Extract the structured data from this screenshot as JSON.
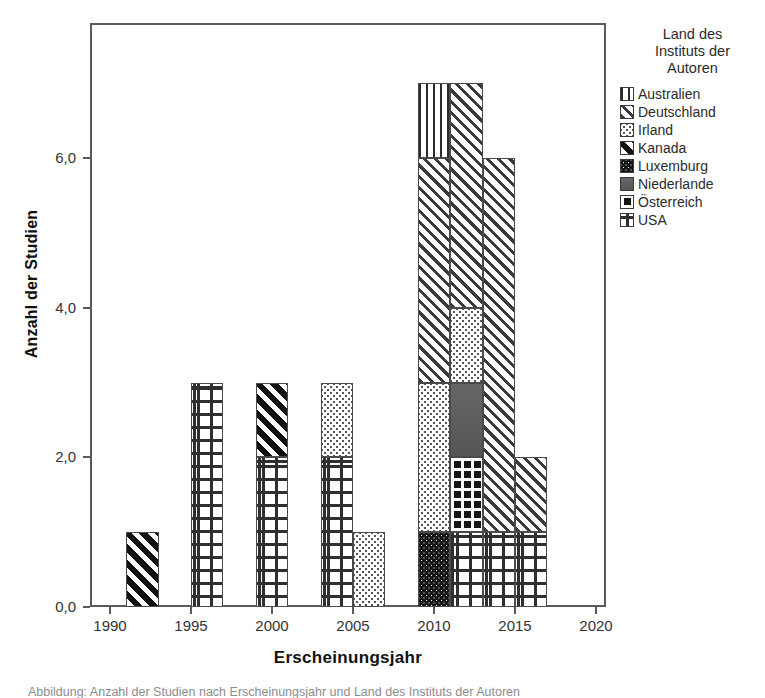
{
  "chart_data": {
    "type": "bar",
    "title": "",
    "xlabel": "Erscheinungsjahr",
    "ylabel": "Anzahl der Studien",
    "xlim": [
      1988.5,
      2021.5
    ],
    "ylim": [
      0,
      7.8
    ],
    "grid": false,
    "legend_position": "right",
    "legend_title": "Land des Instituts der Autoren",
    "stacked": true,
    "series": [
      {
        "name": "Australien",
        "pattern": "vertical-lines"
      },
      {
        "name": "Deutschland",
        "pattern": "diagonal-hatch"
      },
      {
        "name": "Irland",
        "pattern": "light-stipple"
      },
      {
        "name": "Kanada",
        "pattern": "dark-diagonal"
      },
      {
        "name": "Luxemburg",
        "pattern": "dark-dotted"
      },
      {
        "name": "Niederlande",
        "pattern": "solid-gray"
      },
      {
        "name": "Österreich",
        "pattern": "dark-grid"
      },
      {
        "name": "USA",
        "pattern": "cross-hatch"
      }
    ],
    "xticks": [
      1990,
      1995,
      2000,
      2005,
      2010,
      2015,
      2020
    ],
    "xtick_labels": [
      "1990",
      "1995",
      "2000",
      "2005",
      "2010",
      "2015",
      "2020"
    ],
    "yticks": [
      0,
      2,
      4,
      6
    ],
    "ytick_labels": [
      "0,0",
      "2,0",
      "4,0",
      "6,0"
    ],
    "bars": [
      {
        "year_start": 1991,
        "year_end": 1993,
        "total": 1,
        "segments": [
          {
            "name": "Kanada",
            "value": 1
          }
        ]
      },
      {
        "year_start": 1995,
        "year_end": 1997,
        "total": 3,
        "segments": [
          {
            "name": "USA",
            "value": 3
          }
        ]
      },
      {
        "year_start": 1999,
        "year_end": 2001,
        "total": 3,
        "segments": [
          {
            "name": "USA",
            "value": 2
          },
          {
            "name": "Kanada",
            "value": 1
          }
        ]
      },
      {
        "year_start": 2003,
        "year_end": 2005,
        "total": 3,
        "segments": [
          {
            "name": "USA",
            "value": 2
          },
          {
            "name": "Irland",
            "value": 1
          }
        ]
      },
      {
        "year_start": 2005,
        "year_end": 2007,
        "total": 1,
        "segments": [
          {
            "name": "Irland",
            "value": 1
          }
        ]
      },
      {
        "year_start": 2009,
        "year_end": 2011,
        "total": 7,
        "segments": [
          {
            "name": "Luxemburg",
            "value": 1
          },
          {
            "name": "Irland",
            "value": 2
          },
          {
            "name": "Deutschland",
            "value": 3
          },
          {
            "name": "Australien",
            "value": 1
          }
        ]
      },
      {
        "year_start": 2011,
        "year_end": 2013,
        "total": 7,
        "segments": [
          {
            "name": "USA",
            "value": 1
          },
          {
            "name": "Österreich",
            "value": 1
          },
          {
            "name": "Niederlande",
            "value": 1
          },
          {
            "name": "Irland",
            "value": 1
          },
          {
            "name": "Deutschland",
            "value": 3
          }
        ]
      },
      {
        "year_start": 2013,
        "year_end": 2015,
        "total": 6,
        "segments": [
          {
            "name": "USA",
            "value": 1
          },
          {
            "name": "Deutschland",
            "value": 5
          }
        ]
      },
      {
        "year_start": 2015,
        "year_end": 2017,
        "total": 2,
        "segments": [
          {
            "name": "USA",
            "value": 1
          },
          {
            "name": "Deutschland",
            "value": 1
          }
        ]
      }
    ]
  },
  "legend": {
    "title_lines": [
      "Land des",
      "Instituts der",
      "Autoren"
    ],
    "items": [
      {
        "label": "Australien",
        "key": "australien"
      },
      {
        "label": "Deutschland",
        "key": "deutschland"
      },
      {
        "label": "Irland",
        "key": "irland"
      },
      {
        "label": "Kanada",
        "key": "kanada"
      },
      {
        "label": "Luxemburg",
        "key": "luxemburg"
      },
      {
        "label": "Niederlande",
        "key": "niederlande"
      },
      {
        "label": "Österreich",
        "key": "oesterreich"
      },
      {
        "label": "USA",
        "key": "usa"
      }
    ]
  },
  "caption": {
    "text": "Abbildung: Anzahl der Studien nach Erscheinungsjahr und Land des Instituts der Autoren"
  }
}
